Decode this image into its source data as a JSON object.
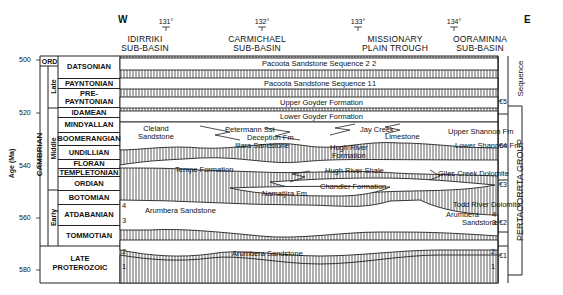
{
  "header": {
    "west": "W",
    "east": "E",
    "longitudes": [
      "131°",
      "132°",
      "133°",
      "134°"
    ],
    "regions": [
      {
        "line1": "IDIRRIKI",
        "line2": "SUB-BASIN"
      },
      {
        "line1": "CARMICHAEL",
        "line2": "SUB-BASIN"
      },
      {
        "line1": "MISSIONARY",
        "line2": "PLAIN TROUGH"
      },
      {
        "line1": "OORAMINNA",
        "line2": "SUB-BASIN"
      }
    ]
  },
  "axis": {
    "label": "Age (Ma)",
    "ticks": [
      "500",
      "520",
      "540",
      "560",
      "580"
    ]
  },
  "periods": {
    "ord": "ORD",
    "cambrian": "CAMBRIAN",
    "late": "Late",
    "middle": "Middle",
    "early": "Early",
    "late_proterozoic_1": "LATE",
    "late_proterozoic_2": "PROTEROZOIC"
  },
  "stages": [
    "DATSONIAN",
    "PAYNTONIAN",
    "PRE-",
    "PAYNTONIAN",
    "IDAMEAN",
    "MINDYALLAN",
    "BOOMERANGIAN",
    "UNDILLIAN",
    "FLORAN",
    "TEMPLETONIAN",
    "ORDIAN",
    "BOTOMIAN",
    "ATDABANIAN",
    "TOMMOTIAN"
  ],
  "formations": {
    "pacoota2": "Pacoota Sandstone Sequence 2",
    "pacoota1": "Pacoota Sandstone Sequence 1",
    "upper_goyder": "Upper Goyder Formation",
    "lower_goyder": "Lower Goyder Formation",
    "cleland1": "Cleland",
    "cleland2": "Sandstone",
    "petermann": "Petermann Sst",
    "deception": "Deception Fm",
    "illara": "Illara Sandstone",
    "jay_creek1": "Jay Creek",
    "jay_creek2": "Limestone",
    "upper_shannon": "Upper Shannon Fm",
    "lower_shannon": "Lower Shannon Fm",
    "hugh_river_fm1": "Hugh River",
    "hugh_river_fm2": "Formation",
    "tempe": "Tempe Formation",
    "hugh_river_shale": "Hugh River Shale",
    "giles_creek": "Giles Creek Dolomite",
    "chandler": "Chandler Formation",
    "namatjira": "Namatjira Fm",
    "arumbera_upper": "Arumbera Sandstone",
    "todd_river": "Todd River Dolomite",
    "arumbera_east1": "Arumbera",
    "arumbera_east2": "Sandstone",
    "arumbera_lower": "Arumbera Sandstone"
  },
  "unit_numbers": {
    "w4": "4",
    "w3": "3",
    "w2": "2",
    "w1": "1",
    "e4": "4",
    "e3": "3",
    "e2": "2",
    "e1": "1",
    "seq2": "2",
    "seq1": "1"
  },
  "sequences": [
    "€5",
    "€4",
    "€3",
    "€2",
    "€1"
  ],
  "right_labels": {
    "sequence": "Sequence",
    "group": "PERTAOORRTA GROUP"
  }
}
